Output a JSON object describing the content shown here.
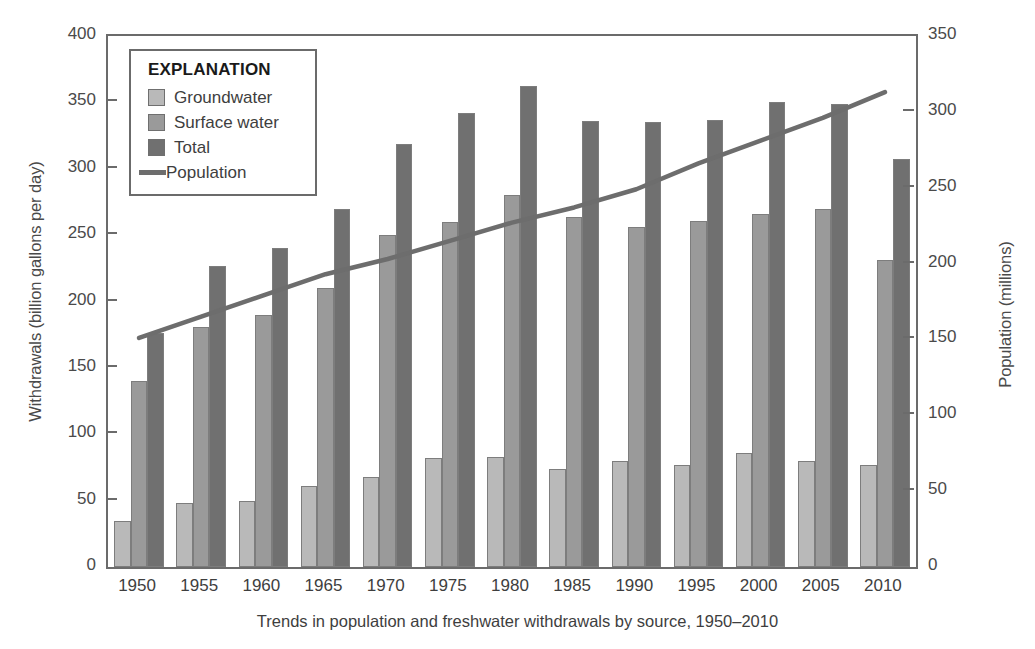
{
  "chart_data": {
    "type": "bar",
    "title": "",
    "caption": "Trends in population and freshwater withdrawals by source, 1950–2010",
    "xlabel": "",
    "ylabel": "Withdrawals (billion gallons per day)",
    "y2label": "Population (millions)",
    "ylim": [
      0,
      400
    ],
    "y2lim": [
      0,
      350
    ],
    "yticks": [
      "0",
      "50",
      "100",
      "150",
      "200",
      "250",
      "300",
      "350",
      "400"
    ],
    "ytick_values": [
      0,
      50,
      100,
      150,
      200,
      250,
      300,
      350,
      400
    ],
    "y2ticks": [
      "0",
      "50",
      "100",
      "150",
      "200",
      "250",
      "300",
      "350"
    ],
    "y2tick_values": [
      0,
      50,
      100,
      150,
      200,
      250,
      300,
      350
    ],
    "grid": false,
    "legend_position": "upper-left",
    "categories": [
      "1950",
      "1955",
      "1960",
      "1965",
      "1970",
      "1975",
      "1980",
      "1985",
      "1990",
      "1995",
      "2000",
      "2005",
      "2010"
    ],
    "series": [
      {
        "name": "Groundwater",
        "type": "bar",
        "color": "#b9b9b9",
        "axis": "left",
        "values": [
          35,
          48,
          50,
          61,
          68,
          82,
          83,
          74,
          80,
          77,
          86,
          80,
          77
        ]
      },
      {
        "name": "Surface water",
        "type": "bar",
        "color": "#9a9a9a",
        "axis": "left",
        "values": [
          140,
          181,
          190,
          210,
          250,
          260,
          280,
          264,
          256,
          261,
          266,
          270,
          231
        ]
      },
      {
        "name": "Total",
        "type": "bar",
        "color": "#707070",
        "axis": "left",
        "values": [
          176,
          227,
          240,
          270,
          319,
          342,
          362,
          336,
          335,
          337,
          350,
          349,
          307
        ]
      },
      {
        "name": "Population",
        "type": "line",
        "color": "#6d6d6d",
        "axis": "right",
        "values": [
          151,
          165,
          179,
          193,
          203,
          215,
          227,
          237,
          249,
          266,
          281,
          296,
          313
        ]
      }
    ]
  },
  "legend": {
    "title": "EXPLANATION",
    "items": [
      {
        "label": "Groundwater",
        "marker": "swatch-groundwater"
      },
      {
        "label": "Surface water",
        "marker": "swatch-surface"
      },
      {
        "label": "Total",
        "marker": "swatch-total"
      },
      {
        "label": "Population",
        "marker": "line-population"
      }
    ]
  },
  "colors": {
    "groundwater": "#b9b9b9",
    "surface_water": "#9a9a9a",
    "total": "#707070",
    "population_line": "#6d6d6d",
    "axis": "#6b6b6b",
    "text": "#3e3e3e",
    "background": "#ffffff"
  }
}
